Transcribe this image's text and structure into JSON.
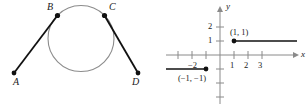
{
  "figure": {
    "left_diagram": {
      "name": "circle-with-two-tangent-segments",
      "circle": {
        "cx": 81,
        "cy": 38.5,
        "r": 33,
        "stroke": "#8c8c8c"
      },
      "points": [
        {
          "id": "A",
          "label": "A",
          "x": 14,
          "y": 73,
          "label_x": 13,
          "label_y": 77
        },
        {
          "id": "B",
          "label": "B",
          "x": 57.5,
          "y": 15.5,
          "label_x": 47,
          "label_y": 2
        },
        {
          "id": "C",
          "label": "C",
          "x": 104.5,
          "y": 15.5,
          "label_x": 109,
          "label_y": 2
        },
        {
          "id": "D",
          "label": "D",
          "x": 138,
          "y": 73,
          "label_x": 132,
          "label_y": 77
        }
      ],
      "segments": [
        {
          "id": "AB",
          "from": "A",
          "to": "B",
          "stroke": "#111111"
        },
        {
          "id": "CD",
          "from": "C",
          "to": "D",
          "stroke": "#111111"
        }
      ]
    },
    "right_diagram": {
      "name": "cartesian-step-function-graph",
      "axes": {
        "x_label": "x",
        "y_label": "y",
        "origin": {
          "x": 220,
          "y": 55
        },
        "unit": 14,
        "x_axis": {
          "x1": 166,
          "x2": 297,
          "y": 55
        },
        "y_axis": {
          "x": 220,
          "y1": 8,
          "y2": 104
        },
        "x_ticks": [
          {
            "value": -3,
            "label": "",
            "px": 178
          },
          {
            "value": -2,
            "label": "−2",
            "px": 192
          },
          {
            "value": -1,
            "label": "",
            "px": 206
          },
          {
            "value": 1,
            "label": "1",
            "px": 234
          },
          {
            "value": 2,
            "label": "2",
            "px": 248
          },
          {
            "value": 3,
            "label": "3",
            "px": 262
          }
        ],
        "y_ticks": [
          {
            "value": 2,
            "label": "2",
            "py": 27
          },
          {
            "value": 1,
            "label": "1",
            "py": 41
          },
          {
            "value": -1,
            "label": "",
            "py": 69
          },
          {
            "value": -2,
            "label": "",
            "py": 83
          },
          {
            "value": -3,
            "label": "",
            "py": 97
          }
        ],
        "stroke": "#8a8a8a"
      },
      "rays": [
        {
          "id": "upper-ray",
          "endpoint_label": "(1, 1)",
          "endpoint": {
            "x": 1,
            "y": 1
          },
          "endpoint_px": {
            "x": 234,
            "y": 41
          },
          "to_px": {
            "x": 297,
            "y": 41
          },
          "direction": "right",
          "closed_endpoint": true,
          "label_px": {
            "x": 230,
            "y": 28
          },
          "stroke": "#111111"
        },
        {
          "id": "lower-ray",
          "endpoint_label": "(−1, −1)",
          "endpoint": {
            "x": -1,
            "y": -1
          },
          "endpoint_px": {
            "x": 206,
            "y": 69
          },
          "to_px": {
            "x": 166,
            "y": 69
          },
          "direction": "left",
          "closed_endpoint": true,
          "label_px": {
            "x": 178,
            "y": 74
          },
          "stroke": "#111111"
        }
      ]
    }
  }
}
